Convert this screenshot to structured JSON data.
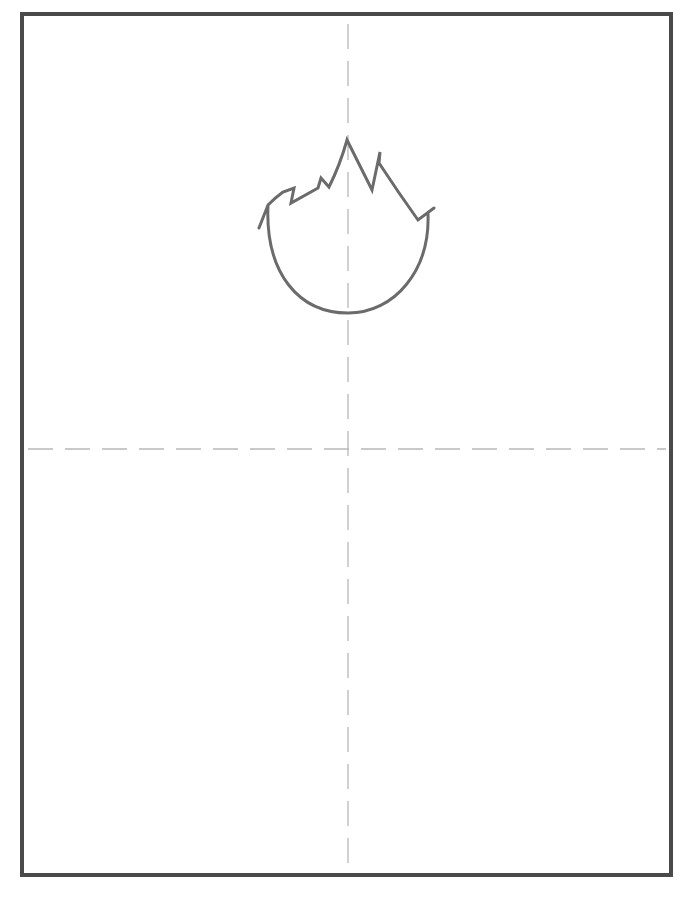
{
  "drawing": {
    "subject": "cartoon head outline with spiky hair",
    "colors": {
      "background": "#ffffff",
      "frame": "#4a4a4a",
      "stroke": "#6b6b6b",
      "guide": "#b8b8b8"
    },
    "frame": {
      "x": 22,
      "y": 14,
      "width": 649,
      "height": 861,
      "stroke_width": 4
    },
    "guides": {
      "vertical_x": 348,
      "horizontal_y": 449,
      "dash": "25 12"
    },
    "head_path": "M259,228 L268,205 Q276,197 283,192 L294,188 L291,203 L318,188 L321,178 L329,187 Q340,165 347,140 L372,190 L380,152 L379,163 Q398,192 418,220 L434,208 M428,214 C430,270 395,313 348,313 C300,313 265,275 268,205"
  }
}
